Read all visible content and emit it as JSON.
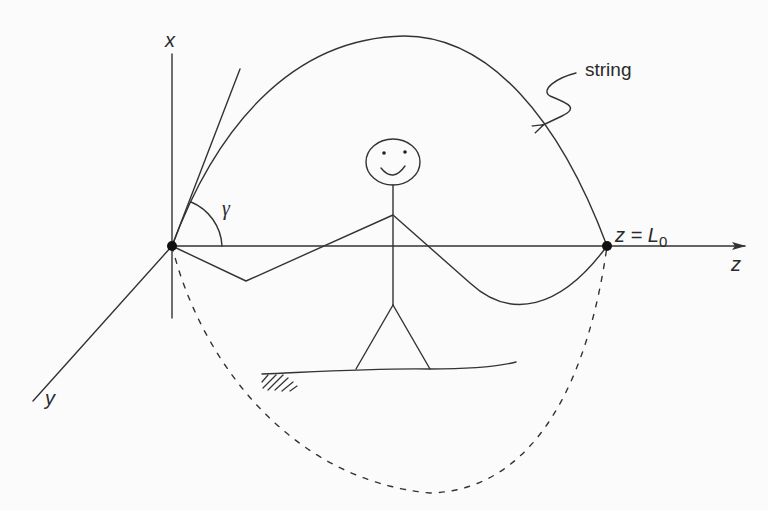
{
  "figure": {
    "type": "diagram",
    "colors": {
      "ink": "#333333",
      "background": "#fbfbfb"
    }
  },
  "axes": {
    "x_label": "x",
    "y_label": "y",
    "z_label": "z"
  },
  "annotations": {
    "string_label": "string",
    "angle_label": "γ",
    "endpoint_label_prefix": "z = ",
    "endpoint_label_L": "L",
    "endpoint_label_sub": "0"
  },
  "elements": [
    {
      "name": "origin-point",
      "description": "Fixed left endpoint of the string at origin"
    },
    {
      "name": "end-point",
      "description": "Fixed right endpoint at z = L0"
    },
    {
      "name": "tangent-line",
      "description": "Tangent to string at origin, forming angle gamma with z-axis"
    },
    {
      "name": "string-upper-arc",
      "description": "Solid string shape arching above the z-axis"
    },
    {
      "name": "string-lower-path",
      "description": "Solid string segment below z-axis held by stick figure hands"
    },
    {
      "name": "string-dashed-arc",
      "description": "Dashed string shape sweeping below the figure"
    },
    {
      "name": "stick-figure",
      "description": "Smiling stick figure standing on ground holding string"
    },
    {
      "name": "ground",
      "description": "Ground line with hatching at left end"
    }
  ]
}
